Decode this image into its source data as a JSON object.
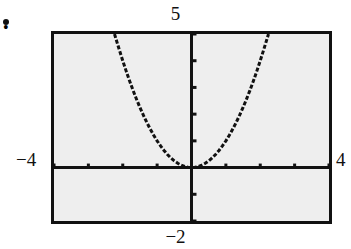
{
  "figure": {
    "bullet": "•",
    "background_color": "#ffffff",
    "screen_background_color": "#eeeeee",
    "frame_color": "#111111",
    "curve_color": "#111111"
  },
  "labels": {
    "ymax": "5",
    "ymin": "−2",
    "xmin": "−4",
    "xmax": "4"
  },
  "chart_data": {
    "type": "line",
    "title": "",
    "xlabel": "",
    "ylabel": "",
    "xlim": [
      -4,
      4
    ],
    "ylim": [
      -2,
      5
    ],
    "grid": false,
    "legend": null,
    "axes": {
      "x_axis_at_y": 0,
      "y_axis_at_x": 0,
      "x_tick_step": 1,
      "y_tick_step": 1,
      "x_ticks": [
        -4,
        -3,
        -2,
        -1,
        0,
        1,
        2,
        3,
        4
      ],
      "y_ticks": [
        -2,
        -1,
        0,
        1,
        2,
        3,
        4,
        5
      ],
      "tick_labels_shown": false,
      "window_labels": {
        "top": "5",
        "bottom": "−2",
        "left": "−4",
        "right": "4"
      }
    },
    "series": [
      {
        "name": "y = x^2",
        "style": "dotted",
        "x": [
          -2.24,
          -2.1,
          -2.0,
          -1.9,
          -1.8,
          -1.7,
          -1.6,
          -1.5,
          -1.4,
          -1.3,
          -1.2,
          -1.1,
          -1.0,
          -0.9,
          -0.8,
          -0.7,
          -0.6,
          -0.5,
          -0.4,
          -0.3,
          -0.2,
          -0.1,
          0.0,
          0.1,
          0.2,
          0.3,
          0.4,
          0.5,
          0.6,
          0.7,
          0.8,
          0.9,
          1.0,
          1.1,
          1.2,
          1.3,
          1.4,
          1.5,
          1.6,
          1.7,
          1.8,
          1.9,
          2.0,
          2.1,
          2.24
        ],
        "values": [
          5.0,
          4.41,
          4.0,
          3.61,
          3.24,
          2.89,
          2.56,
          2.25,
          1.96,
          1.69,
          1.44,
          1.21,
          1.0,
          0.81,
          0.64,
          0.49,
          0.36,
          0.25,
          0.16,
          0.09,
          0.04,
          0.01,
          0.0,
          0.01,
          0.04,
          0.09,
          0.16,
          0.25,
          0.36,
          0.49,
          0.64,
          0.81,
          1.0,
          1.21,
          1.44,
          1.69,
          1.96,
          2.25,
          2.56,
          2.89,
          3.24,
          3.61,
          4.0,
          4.41,
          5.0
        ]
      }
    ],
    "annotations": [
      {
        "text": "vertex at origin (0, 0)"
      }
    ]
  }
}
